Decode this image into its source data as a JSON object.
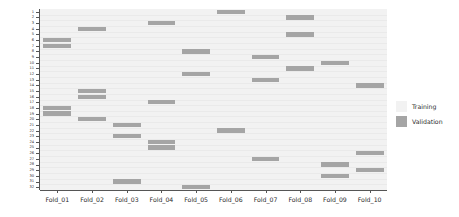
{
  "chart_data": {
    "type": "heatmap",
    "title": "",
    "xlabel": "",
    "ylabel": "Observation ID",
    "grid": true,
    "legend_position": "right",
    "x_categories": [
      "Fold_01",
      "Fold_02",
      "Fold_03",
      "Fold_04",
      "Fold_05",
      "Fold_06",
      "Fold_07",
      "Fold_08",
      "Fold_09",
      "Fold_10"
    ],
    "y_categories": [
      "1",
      "2",
      "3",
      "4",
      "5",
      "6",
      "7",
      "8",
      "9",
      "10",
      "11",
      "12",
      "13",
      "14",
      "15",
      "16",
      "17",
      "18",
      "19",
      "20",
      "21",
      "22",
      "23",
      "24",
      "25",
      "26",
      "27",
      "28",
      "29",
      "30",
      "31",
      "32"
    ],
    "value_labels": [
      "Training",
      "Validation"
    ],
    "colors": {
      "training": "#f2f2f2",
      "validation": "#a5a5a5",
      "axis": "#555555",
      "text": "#2b2b2b",
      "background": "#ffffff",
      "gridline": "#eaeaea"
    },
    "note": "Each observation row is assigned to exactly one validation fold; all other folds are training.",
    "validation_fold_by_observation": [
      6,
      8,
      4,
      2,
      8,
      1,
      1,
      5,
      7,
      9,
      8,
      5,
      7,
      10,
      2,
      2,
      4,
      1,
      1,
      2,
      3,
      6,
      3,
      4,
      4,
      10,
      7,
      9,
      10,
      9,
      3,
      5
    ],
    "validation_observations_by_fold": [
      {
        "fold": "Fold_01",
        "observations": [
          6,
          7,
          18,
          19
        ]
      },
      {
        "fold": "Fold_02",
        "observations": [
          4,
          15,
          16,
          20
        ]
      },
      {
        "fold": "Fold_03",
        "observations": [
          21,
          23,
          31
        ]
      },
      {
        "fold": "Fold_04",
        "observations": [
          3,
          17,
          24,
          25
        ]
      },
      {
        "fold": "Fold_05",
        "observations": [
          8,
          12,
          32
        ]
      },
      {
        "fold": "Fold_06",
        "observations": [
          1,
          22
        ]
      },
      {
        "fold": "Fold_07",
        "observations": [
          9,
          13,
          27
        ]
      },
      {
        "fold": "Fold_08",
        "observations": [
          2,
          5,
          11
        ]
      },
      {
        "fold": "Fold_09",
        "observations": [
          10,
          28,
          30
        ]
      },
      {
        "fold": "Fold_10",
        "observations": [
          14,
          26,
          29
        ]
      }
    ]
  },
  "axes": {
    "y_title": "Observation ID",
    "x_tick_labels": [
      "Fold_01",
      "Fold_02",
      "Fold_03",
      "Fold_04",
      "Fold_05",
      "Fold_06",
      "Fold_07",
      "Fold_08",
      "Fold_09",
      "Fold_10"
    ],
    "y_tick_labels": [
      "1",
      "2",
      "3",
      "4",
      "5",
      "6",
      "7",
      "8",
      "9",
      "10",
      "11",
      "12",
      "13",
      "14",
      "15",
      "16",
      "17",
      "18",
      "19",
      "20",
      "21",
      "22",
      "23",
      "24",
      "25",
      "26",
      "27",
      "28",
      "29",
      "30",
      "31",
      "32"
    ]
  },
  "legend": {
    "entries": [
      {
        "label": "Training",
        "color": "#f2f2f2"
      },
      {
        "label": "Validation",
        "color": "#a5a5a5"
      }
    ]
  }
}
